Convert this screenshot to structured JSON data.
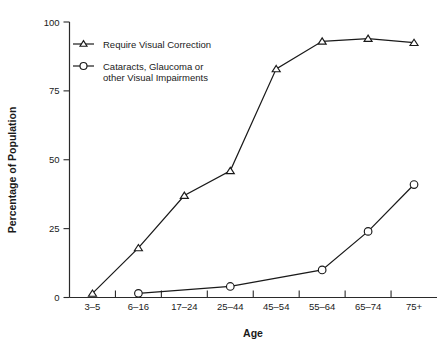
{
  "chart_data": {
    "type": "line",
    "title": "",
    "xlabel": "Age",
    "ylabel": "Percentage of Population",
    "categories": [
      "3–5",
      "6–16",
      "17–24",
      "25–44",
      "45–54",
      "55–64",
      "65–74",
      "75+"
    ],
    "ylim": [
      0,
      100
    ],
    "yticks": [
      0,
      25,
      50,
      75,
      100
    ],
    "ytick_labels": [
      "0",
      "25",
      "50",
      "75",
      "100"
    ],
    "grid": false,
    "legend_position": "upper-left-inside",
    "series": [
      {
        "name": "Require Visual Correction",
        "marker": "triangle",
        "values": [
          1.5,
          18,
          37,
          46,
          83,
          93,
          94,
          92.5
        ]
      },
      {
        "name": "Cataracts, Glaucoma or other Visual Impairments",
        "marker": "circle",
        "values": [
          null,
          1.5,
          null,
          4,
          null,
          10,
          24,
          41
        ]
      }
    ]
  },
  "legend": {
    "entries": [
      {
        "label": "Require Visual Correction",
        "marker": "triangle-marker-icon"
      },
      {
        "label_line1": "Cataracts, Glaucoma or",
        "label_line2": "other Visual Impairments",
        "marker": "circle-marker-icon"
      }
    ]
  },
  "axes": {
    "x_title": "Age",
    "y_title": "Percentage of Population"
  }
}
